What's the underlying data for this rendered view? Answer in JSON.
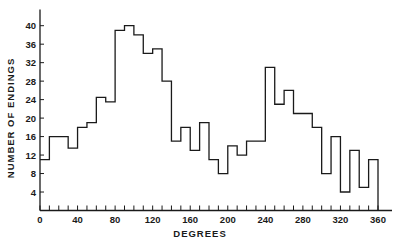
{
  "chart_data": {
    "type": "bar",
    "subtype": "step-histogram",
    "title": "",
    "xlabel": "DEGREES",
    "ylabel": "NUMBER OF ENDINGS",
    "xlim": [
      0,
      360
    ],
    "ylim": [
      0,
      42
    ],
    "x_ticks": [
      0,
      40,
      80,
      120,
      160,
      200,
      240,
      280,
      320,
      360
    ],
    "y_ticks": [
      4,
      8,
      12,
      16,
      20,
      24,
      28,
      32,
      36,
      40
    ],
    "bin_width": 10,
    "grid": false,
    "legend": null,
    "bins": [
      0,
      10,
      20,
      30,
      40,
      50,
      60,
      70,
      80,
      90,
      100,
      110,
      120,
      130,
      140,
      150,
      160,
      170,
      180,
      190,
      200,
      210,
      220,
      230,
      240,
      250,
      260,
      270,
      280,
      290,
      300,
      310,
      320,
      330,
      340,
      350
    ],
    "values": [
      11,
      16,
      16,
      13.5,
      18,
      19,
      24.5,
      23.5,
      39,
      40,
      38,
      34,
      35,
      28,
      15,
      18,
      13,
      19,
      11,
      8,
      14,
      12,
      15,
      15,
      31,
      23,
      26,
      21,
      21,
      18,
      8,
      16,
      4,
      13,
      5,
      11
    ]
  }
}
